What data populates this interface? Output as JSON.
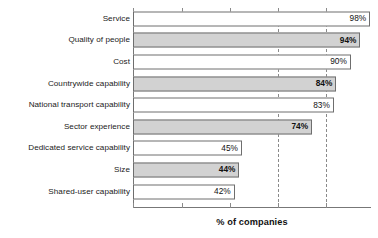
{
  "chart_data": {
    "type": "bar",
    "orientation": "horizontal",
    "title": "",
    "xlabel": "% of companies",
    "ylabel": "",
    "xlim": [
      0,
      100
    ],
    "grid": true,
    "gridlines_at": [
      60,
      80
    ],
    "ticks_at": [
      0,
      20,
      40,
      60,
      80
    ],
    "legend": "none",
    "categories": [
      "Service",
      "Quality of people",
      "Cost",
      "Countrywide capability",
      "National transport capability",
      "Sector experience",
      "Dedicated service capability",
      "Size",
      "Shared-user capability"
    ],
    "values": [
      98,
      94,
      90,
      84,
      83,
      74,
      45,
      44,
      42
    ],
    "value_labels": [
      "98%",
      "94%",
      "90%",
      "84%",
      "83%",
      "74%",
      "45%",
      "44%",
      "42%"
    ],
    "bar_styles": [
      "white",
      "shaded",
      "white",
      "shaded",
      "white",
      "shaded",
      "white",
      "shaded",
      "white"
    ]
  },
  "colors": {
    "bar_shaded_fill": "#d2d2d2",
    "bar_white_fill": "#ffffff",
    "bar_border": "#6e6e6e",
    "axis_line": "#777777",
    "gridline": "#8a8a8a",
    "text": "#1a1a1a",
    "background": "#ffffff"
  }
}
